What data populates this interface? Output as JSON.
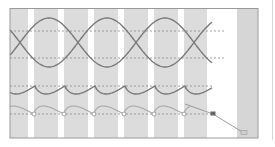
{
  "diagram": {
    "title": "",
    "colors": {
      "background": "#ffffff",
      "stripe": "#dcdcdc",
      "frame": "#9a9a9a",
      "wave_primary": "#7a7a7a",
      "wave_secondary": "#a8a8a8",
      "dashed_reference": "#8c8c8c",
      "marker_open": "#ffffff",
      "marker_filled": "#666666",
      "diagonal_line": "#9c9c9c",
      "right_panel": "#d6d6d6"
    },
    "stripe_count": 7,
    "rows": [
      {
        "name": "sine-pair-row",
        "kind": "crossing-sine-pair",
        "cycles": 3.3
      },
      {
        "name": "cusp-wave-row",
        "kind": "scalloped-cusp",
        "cycles": 7
      },
      {
        "name": "arc-marker-row",
        "kind": "arcs-with-open-markers",
        "markers": 6
      }
    ],
    "trace": {
      "name": "diagonal-trace",
      "points": 3,
      "middle_marker": "filled-square",
      "end_marker": "small-light-square"
    }
  }
}
